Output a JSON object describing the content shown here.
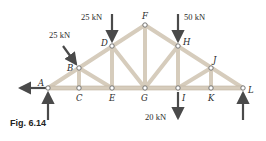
{
  "caption": "Fig. 6.14",
  "nodes": {
    "A": {
      "label": "A"
    },
    "B": {
      "label": "B"
    },
    "C": {
      "label": "C"
    },
    "D": {
      "label": "D"
    },
    "E": {
      "label": "E"
    },
    "F": {
      "label": "F"
    },
    "G": {
      "label": "G"
    },
    "H": {
      "label": "H"
    },
    "I": {
      "label": "I"
    },
    "J": {
      "label": "J"
    },
    "K": {
      "label": "K"
    },
    "L": {
      "label": "L"
    }
  },
  "loads": {
    "at_B": "25 kN",
    "at_D": "25 kN",
    "at_H": "50 kN",
    "at_I": "20 kN"
  },
  "colors": {
    "member": "#d9cfc0",
    "member_edge": "#b9ad9a",
    "arrow": "#4a4a4a",
    "node": "#ffffff"
  }
}
